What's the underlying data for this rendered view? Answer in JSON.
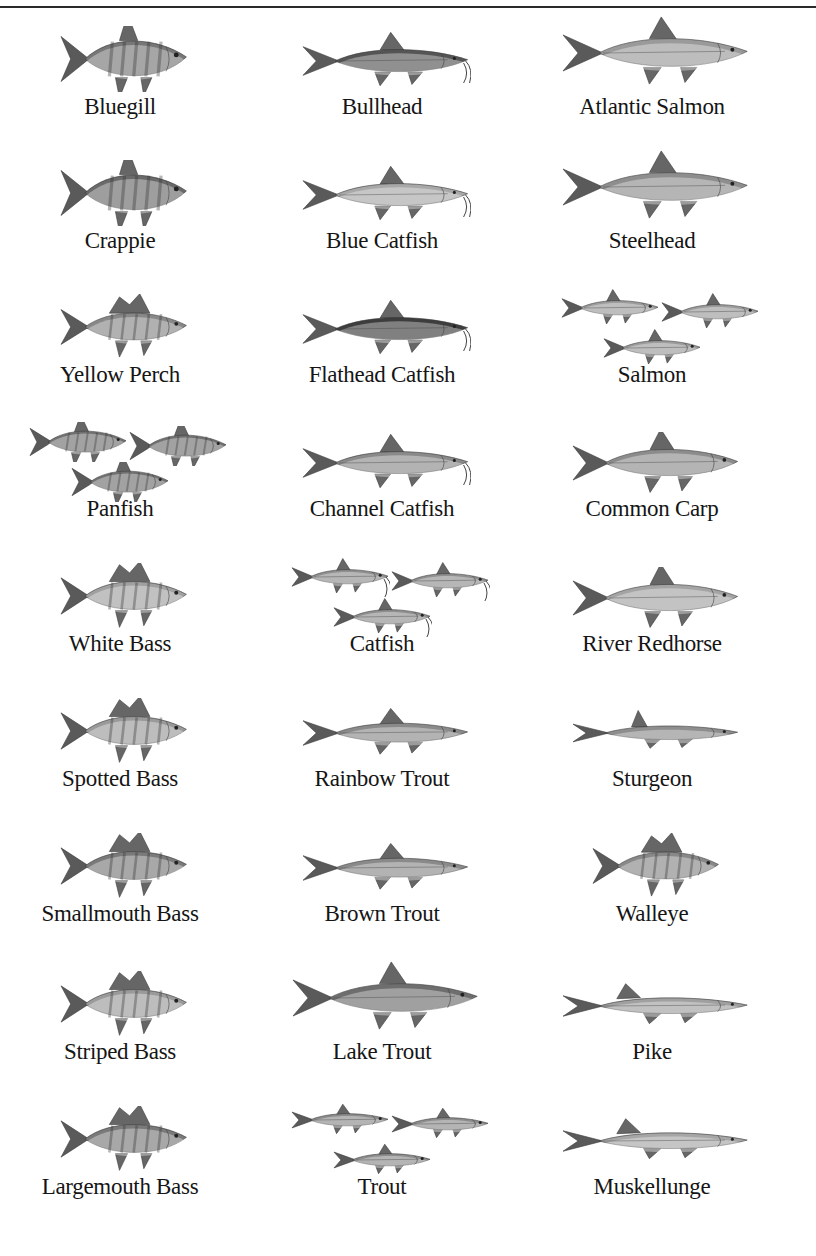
{
  "page": {
    "rule_color": "#2a2a2a",
    "text_color": "#151515"
  },
  "columns": [
    {
      "center_x": 120
    },
    {
      "center_x": 382
    },
    {
      "center_x": 652
    }
  ],
  "rows_y": [
    12,
    146,
    280,
    414,
    549,
    684,
    819,
    957,
    1092
  ],
  "fish": [
    {
      "name": "Bluegill",
      "icon": "bluegill-icon",
      "shape": "panfish",
      "count": 1,
      "tone": "#777"
    },
    {
      "name": "Bullhead",
      "icon": "bullhead-icon",
      "shape": "catfish",
      "count": 1,
      "tone": "#555"
    },
    {
      "name": "Atlantic Salmon",
      "icon": "atlantic-salmon-icon",
      "shape": "salmon",
      "count": 1,
      "tone": "#9a9a9a"
    },
    {
      "name": "Crappie",
      "icon": "crappie-icon",
      "shape": "panfish",
      "count": 1,
      "tone": "#6a6a6a"
    },
    {
      "name": "Blue Catfish",
      "icon": "blue-catfish-icon",
      "shape": "catfish",
      "count": 1,
      "tone": "#a8a8a8"
    },
    {
      "name": "Steelhead",
      "icon": "steelhead-icon",
      "shape": "salmon",
      "count": 1,
      "tone": "#8e8e8e"
    },
    {
      "name": "Yellow Perch",
      "icon": "yellow-perch-icon",
      "shape": "perch",
      "count": 1,
      "tone": "#888"
    },
    {
      "name": "Flathead Catfish",
      "icon": "flathead-catfish-icon",
      "shape": "catfish",
      "count": 1,
      "tone": "#3d3d3d"
    },
    {
      "name": "Salmon",
      "icon": "salmon-group-icon",
      "shape": "salmon",
      "count": 3,
      "tone": "#9c9c9c"
    },
    {
      "name": "Panfish",
      "icon": "panfish-group-icon",
      "shape": "panfish",
      "count": 3,
      "tone": "#707070"
    },
    {
      "name": "Channel Catfish",
      "icon": "channel-catfish-icon",
      "shape": "catfish",
      "count": 1,
      "tone": "#8a8a8a"
    },
    {
      "name": "Common Carp",
      "icon": "common-carp-icon",
      "shape": "carp",
      "count": 1,
      "tone": "#8c8c8c"
    },
    {
      "name": "White Bass",
      "icon": "white-bass-icon",
      "shape": "bass",
      "count": 1,
      "tone": "#a0a0a0"
    },
    {
      "name": "Catfish",
      "icon": "catfish-group-icon",
      "shape": "catfish",
      "count": 3,
      "tone": "#8f8f8f"
    },
    {
      "name": "River Redhorse",
      "icon": "river-redhorse-icon",
      "shape": "carp",
      "count": 1,
      "tone": "#a4a4a4"
    },
    {
      "name": "Spotted Bass",
      "icon": "spotted-bass-icon",
      "shape": "bass",
      "count": 1,
      "tone": "#9a9a9a"
    },
    {
      "name": "Rainbow Trout",
      "icon": "rainbow-trout-icon",
      "shape": "trout",
      "count": 1,
      "tone": "#8a8a8a"
    },
    {
      "name": "Sturgeon",
      "icon": "sturgeon-icon",
      "shape": "sturgeon",
      "count": 1,
      "tone": "#8e8e8e"
    },
    {
      "name": "Smallmouth Bass",
      "icon": "smallmouth-bass-icon",
      "shape": "bass",
      "count": 1,
      "tone": "#7a7a7a"
    },
    {
      "name": "Brown Trout",
      "icon": "brown-trout-icon",
      "shape": "trout",
      "count": 1,
      "tone": "#8a8a8a"
    },
    {
      "name": "Walleye",
      "icon": "walleye-icon",
      "shape": "perch",
      "count": 1,
      "tone": "#888"
    },
    {
      "name": "Striped Bass",
      "icon": "striped-bass-icon",
      "shape": "bass",
      "count": 1,
      "tone": "#9a9a9a"
    },
    {
      "name": "Lake Trout",
      "icon": "lake-trout-icon",
      "shape": "salmon",
      "count": 1,
      "tone": "#6e6e6e"
    },
    {
      "name": "Pike",
      "icon": "pike-icon",
      "shape": "pike",
      "count": 1,
      "tone": "#a0a0a0"
    },
    {
      "name": "Largemouth Bass",
      "icon": "largemouth-bass-icon",
      "shape": "bass",
      "count": 1,
      "tone": "#7a7a7a"
    },
    {
      "name": "Trout",
      "icon": "trout-group-icon",
      "shape": "trout",
      "count": 3,
      "tone": "#8c8c8c"
    },
    {
      "name": "Muskellunge",
      "icon": "muskellunge-icon",
      "shape": "pike",
      "count": 1,
      "tone": "#a6a6a6"
    }
  ]
}
